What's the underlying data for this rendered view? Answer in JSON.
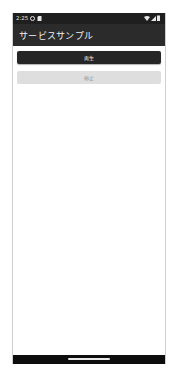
{
  "status_bar": {
    "time": "2:25",
    "icons": [
      "settings-gear-icon",
      "sd-card-icon",
      "wifi-icon",
      "cell-signal-icon",
      "battery-icon"
    ]
  },
  "app_bar": {
    "title": "サービスサンプル"
  },
  "buttons": {
    "play": {
      "label": "再生",
      "enabled": true
    },
    "stop": {
      "label": "停止",
      "enabled": false
    }
  },
  "colors": {
    "app_bar": "#2b2b2b",
    "status_bar": "#1f1f1f",
    "play_button": "#262626",
    "stop_button_disabled": "#dedede"
  }
}
